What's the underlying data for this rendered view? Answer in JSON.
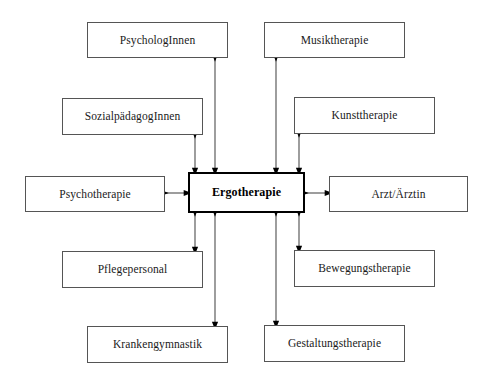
{
  "diagram": {
    "center": {
      "id": "ergotherapie",
      "label": "Ergotherapie",
      "x": 188,
      "y": 172,
      "w": 117,
      "h": 41
    },
    "nodes": [
      {
        "id": "psychologinnen",
        "label": "PsychologInnen",
        "x": 87,
        "y": 22,
        "w": 141,
        "h": 36
      },
      {
        "id": "musiktherapie",
        "label": "Musiktherapie",
        "x": 264,
        "y": 22,
        "w": 141,
        "h": 36
      },
      {
        "id": "sozialpaedagoginnen",
        "label": "SozialpädagogInnen",
        "x": 62,
        "y": 98,
        "w": 141,
        "h": 37
      },
      {
        "id": "kunsttherapie",
        "label": "Kunsttherapie",
        "x": 294,
        "y": 97,
        "w": 141,
        "h": 37
      },
      {
        "id": "psychotherapie",
        "label": "Psychotherapie",
        "x": 25,
        "y": 176,
        "w": 140,
        "h": 36
      },
      {
        "id": "arzt-aerztin",
        "label": "Arzt/Ärztin",
        "x": 329,
        "y": 176,
        "w": 139,
        "h": 36
      },
      {
        "id": "pflegepersonal",
        "label": "Pflegepersonal",
        "x": 62,
        "y": 251,
        "w": 141,
        "h": 37
      },
      {
        "id": "bewegungstherapie",
        "label": "Bewegungstherapie",
        "x": 294,
        "y": 250,
        "w": 141,
        "h": 37
      },
      {
        "id": "krankengymnastik",
        "label": "Krankengymnastik",
        "x": 87,
        "y": 326,
        "w": 141,
        "h": 37
      },
      {
        "id": "gestaltungstherapie",
        "label": "Gestaltungstherapie",
        "x": 264,
        "y": 325,
        "w": 141,
        "h": 37
      }
    ],
    "connectors": [
      {
        "id": "arrow-psychologinnen",
        "from": "psychologinnen",
        "to": "ergotherapie",
        "orientation": "vertical",
        "x1": 215,
        "y1": 58,
        "x2": 215,
        "y2": 172
      },
      {
        "id": "arrow-musiktherapie",
        "from": "musiktherapie",
        "to": "ergotherapie",
        "orientation": "vertical",
        "x1": 276,
        "y1": 58,
        "x2": 276,
        "y2": 172
      },
      {
        "id": "arrow-sozialpaedagoginnen",
        "from": "sozialpaedagoginnen",
        "to": "ergotherapie",
        "orientation": "vertical",
        "x1": 195,
        "y1": 135,
        "x2": 195,
        "y2": 172
      },
      {
        "id": "arrow-kunsttherapie",
        "from": "kunsttherapie",
        "to": "ergotherapie",
        "orientation": "vertical",
        "x1": 299,
        "y1": 134,
        "x2": 299,
        "y2": 172
      },
      {
        "id": "arrow-psychotherapie",
        "from": "psychotherapie",
        "to": "ergotherapie",
        "orientation": "horizontal",
        "x1": 165,
        "y1": 193,
        "x2": 188,
        "y2": 193
      },
      {
        "id": "arrow-arzt-aerztin",
        "from": "arzt-aerztin",
        "to": "ergotherapie",
        "orientation": "horizontal",
        "x1": 305,
        "y1": 193,
        "x2": 329,
        "y2": 193
      },
      {
        "id": "arrow-pflegepersonal",
        "from": "pflegepersonal",
        "to": "ergotherapie",
        "orientation": "vertical",
        "x1": 195,
        "y1": 213,
        "x2": 195,
        "y2": 251
      },
      {
        "id": "arrow-bewegungstherapie",
        "from": "bewegungstherapie",
        "to": "ergotherapie",
        "orientation": "vertical",
        "x1": 299,
        "y1": 213,
        "x2": 299,
        "y2": 250
      },
      {
        "id": "arrow-krankengymnastik",
        "from": "krankengymnastik",
        "to": "ergotherapie",
        "orientation": "vertical",
        "x1": 215,
        "y1": 213,
        "x2": 215,
        "y2": 326
      },
      {
        "id": "arrow-gestaltungstherapie",
        "from": "gestaltungstherapie",
        "to": "ergotherapie",
        "orientation": "vertical",
        "x1": 276,
        "y1": 213,
        "x2": 276,
        "y2": 325
      }
    ],
    "colors": {
      "background": "#ffffff",
      "node_border": "#555555",
      "center_border": "#000000",
      "arrow": "#4d4d4d",
      "arrowhead": "#000000",
      "text": "#1a1a1a"
    }
  }
}
